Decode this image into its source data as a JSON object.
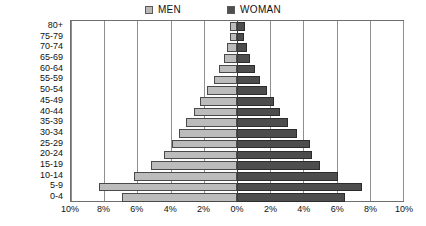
{
  "chart_data": {
    "type": "bar",
    "subtype": "population-pyramid",
    "title": "",
    "xlabel": "",
    "ylabel": "",
    "categories": [
      "80+",
      "75-79",
      "70-74",
      "65-69",
      "60-64",
      "55-59",
      "50-54",
      "45-49",
      "40-44",
      "35-39",
      "30-34",
      "25-29",
      "20-24",
      "15-19",
      "10-14",
      "5-9",
      "0-4"
    ],
    "series": [
      {
        "name": "MEN",
        "side": "left",
        "color": "#bcbcbc",
        "values": [
          0.4,
          0.4,
          0.6,
          0.8,
          1.1,
          1.4,
          1.8,
          2.2,
          2.6,
          3.1,
          3.5,
          3.9,
          4.4,
          5.2,
          6.2,
          8.3,
          6.9
        ]
      },
      {
        "name": "WOMAN",
        "side": "right",
        "color": "#4d4d4d",
        "values": [
          0.5,
          0.4,
          0.6,
          0.8,
          1.1,
          1.4,
          1.8,
          2.2,
          2.6,
          3.1,
          3.6,
          4.4,
          4.5,
          5.0,
          6.1,
          7.5,
          6.5
        ]
      }
    ],
    "xlim": [
      -10,
      10
    ],
    "xticks": [
      -10,
      -8,
      -6,
      -4,
      -2,
      0,
      2,
      4,
      6,
      8,
      10
    ],
    "xticklabels": [
      "10%",
      "8%",
      "6%",
      "4%",
      "2%",
      "0%",
      "2%",
      "4%",
      "6%",
      "8%",
      "10%"
    ],
    "grid": true,
    "grid_axis": "x",
    "legend_position": "top-center",
    "value_unit": "%"
  },
  "legend": {
    "men": {
      "label": "MEN",
      "color": "#bcbcbc"
    },
    "woman": {
      "label": "WOMAN",
      "color": "#4d4d4d"
    }
  }
}
